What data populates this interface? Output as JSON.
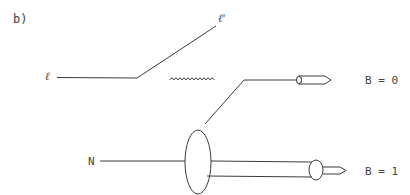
{
  "panel_label": "b)",
  "labels": {
    "incoming_lepton": "ℓ",
    "outgoing_lepton": "ℓ'",
    "nucleon": "N",
    "upper_final_state": "B = 0",
    "lower_final_state": "B = 1"
  },
  "diagram": {
    "type": "deep-inelastic scattering schematic",
    "elements": [
      {
        "name": "incoming-lepton-line",
        "kind": "straight line"
      },
      {
        "name": "outgoing-lepton-line",
        "kind": "straight line"
      },
      {
        "name": "virtual-photon",
        "kind": "wavy line"
      },
      {
        "name": "upper-hadron-jet",
        "kind": "line to capsule/arrow",
        "baryon_number": 0
      },
      {
        "name": "nucleon-blob",
        "kind": "ellipse"
      },
      {
        "name": "lower-hadron-jet",
        "kind": "double line to circle/arrow",
        "baryon_number": 1
      }
    ]
  },
  "colors": {
    "ink": "#3a3a3a",
    "background": "#ffffff"
  }
}
